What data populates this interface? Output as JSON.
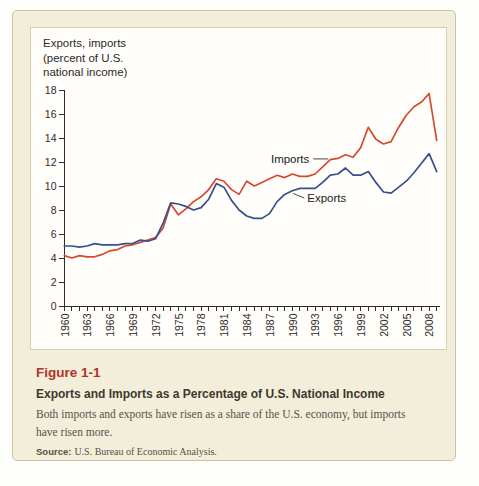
{
  "figure": {
    "label": "Figure 1-1",
    "title": "Exports and Imports as a Percentage of U.S. National Income",
    "caption_lines": [
      "Both imports and exports have risen as a share of the U.S. economy, but imports",
      "have risen more."
    ],
    "source_label": "Source:",
    "source_text": "U.S. Bureau of Economic Analysis."
  },
  "chart_data": {
    "type": "line",
    "axis_title_lines": [
      "Exports, imports",
      "(percent of U.S.",
      "national income)"
    ],
    "xlabel": "",
    "ylabel": "Exports, imports (percent of U.S. national income)",
    "ylim": [
      0,
      18
    ],
    "ytick_step": 2,
    "grid": false,
    "legend": "inline-annotations",
    "x": [
      1960,
      1961,
      1962,
      1963,
      1964,
      1965,
      1966,
      1967,
      1968,
      1969,
      1970,
      1971,
      1972,
      1973,
      1974,
      1975,
      1976,
      1977,
      1978,
      1979,
      1980,
      1981,
      1982,
      1983,
      1984,
      1985,
      1986,
      1987,
      1988,
      1989,
      1990,
      1991,
      1992,
      1993,
      1994,
      1995,
      1996,
      1997,
      1998,
      1999,
      2000,
      2001,
      2002,
      2003,
      2004,
      2005,
      2006,
      2007,
      2008,
      2009
    ],
    "xtick_labels": [
      "1960",
      "1963",
      "1966",
      "1969",
      "1972",
      "1975",
      "1978",
      "1981",
      "1984",
      "1987",
      "1990",
      "1993",
      "1996",
      "1999",
      "2002",
      "2005",
      "2008"
    ],
    "series": [
      {
        "name": "Imports",
        "color": "#d7492f",
        "values": [
          4.2,
          4.0,
          4.2,
          4.1,
          4.1,
          4.3,
          4.6,
          4.7,
          5.0,
          5.1,
          5.3,
          5.5,
          5.7,
          6.5,
          8.5,
          7.6,
          8.1,
          8.7,
          9.1,
          9.7,
          10.6,
          10.4,
          9.7,
          9.3,
          10.4,
          10.0,
          10.3,
          10.6,
          10.9,
          10.7,
          11.0,
          10.8,
          10.8,
          11.0,
          11.6,
          12.2,
          12.3,
          12.6,
          12.4,
          13.2,
          14.9,
          13.9,
          13.5,
          13.7,
          14.9,
          15.9,
          16.6,
          17.0,
          17.7,
          13.8
        ]
      },
      {
        "name": "Exports",
        "color": "#35508d",
        "values": [
          5.0,
          5.0,
          4.9,
          5.0,
          5.2,
          5.1,
          5.1,
          5.1,
          5.2,
          5.2,
          5.5,
          5.4,
          5.6,
          6.9,
          8.6,
          8.5,
          8.3,
          8.0,
          8.2,
          8.9,
          10.2,
          9.9,
          8.8,
          8.0,
          7.5,
          7.3,
          7.3,
          7.7,
          8.7,
          9.3,
          9.6,
          9.8,
          9.8,
          9.8,
          10.3,
          10.9,
          11.0,
          11.5,
          10.9,
          10.9,
          11.2,
          10.3,
          9.5,
          9.4,
          9.9,
          10.4,
          11.1,
          11.9,
          12.7,
          11.2
        ]
      }
    ],
    "annotations": [
      {
        "text": "Imports",
        "year": 1995,
        "value": 12.3,
        "side": "left"
      },
      {
        "text": "Exports",
        "year": 1990,
        "value": 9.5,
        "side": "right"
      }
    ]
  },
  "colors": {
    "card_bg": "#f3eed9",
    "card_border": "#cbc29e",
    "panel_bg": "#fffefa",
    "figure_label": "#b23227",
    "imports_line": "#d7492f",
    "exports_line": "#35508d"
  }
}
